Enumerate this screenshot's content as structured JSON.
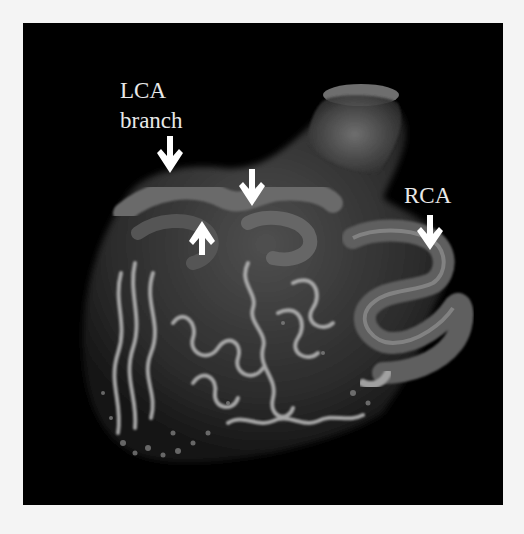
{
  "figure": {
    "background_color": "#f4f4f4",
    "panel_color": "#000000",
    "annotation_color": "#ffffff"
  },
  "labels": {
    "lca_line1": "LCA",
    "lca_line2": "branch",
    "rca": "RCA"
  },
  "arrows": [
    {
      "name": "lca-branch-arrow",
      "direction": "down"
    },
    {
      "name": "lca-up-arrow",
      "direction": "up"
    },
    {
      "name": "lca-mid-arrow",
      "direction": "down"
    },
    {
      "name": "rca-arrow",
      "direction": "down"
    }
  ]
}
